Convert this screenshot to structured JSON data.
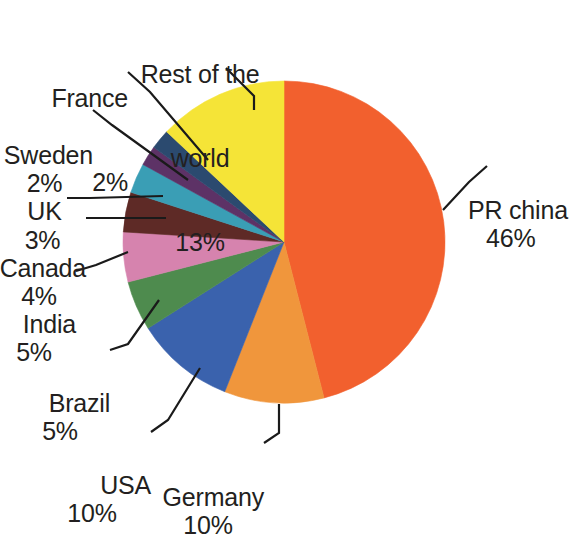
{
  "chart_data": {
    "type": "pie",
    "title": "",
    "subtitle": "",
    "xlabel": "",
    "ylabel": "",
    "legend_position": "none",
    "grid": false,
    "label_format": "name + percent",
    "start_angle_deg": 0,
    "direction": "clockwise",
    "categories": [
      "PR china",
      "Germany",
      "USA",
      "Brazil",
      "India",
      "Canada",
      "UK",
      "Sweden",
      "France",
      "Rest of the world"
    ],
    "values": [
      46,
      10,
      10,
      5,
      5,
      4,
      3,
      2,
      2,
      13
    ],
    "value_labels": [
      "46%",
      "10%",
      "10%",
      "5%",
      "5%",
      "4%",
      "3%",
      "2%",
      "2%",
      "13%"
    ],
    "colors": [
      "#F2602E",
      "#F0963C",
      "#3A62AD",
      "#4E8B4E",
      "#D683AE",
      "#5E2A26",
      "#3A9EB5",
      "#5D3266",
      "#2B4A6F",
      "#F5E437"
    ],
    "slices": [
      {
        "name": "PR china",
        "percent": 46,
        "label": "PR china",
        "value_label": "46%",
        "color": "#F2602E"
      },
      {
        "name": "Germany",
        "percent": 10,
        "label": "Germany",
        "value_label": "10%",
        "color": "#F0963C"
      },
      {
        "name": "USA",
        "percent": 10,
        "label": "USA",
        "value_label": "10%",
        "color": "#3A62AD"
      },
      {
        "name": "Brazil",
        "percent": 5,
        "label": "Brazil",
        "value_label": "5%",
        "color": "#4E8B4E"
      },
      {
        "name": "India",
        "percent": 5,
        "label": "India",
        "value_label": "5%",
        "color": "#D683AE"
      },
      {
        "name": "Canada",
        "percent": 4,
        "label": "Canada",
        "value_label": "4%",
        "color": "#5E2A26"
      },
      {
        "name": "UK",
        "percent": 3,
        "label": "UK",
        "value_label": "3%",
        "color": "#3A9EB5"
      },
      {
        "name": "Sweden",
        "percent": 2,
        "label": "Sweden",
        "value_label": "2%",
        "color": "#5D3266"
      },
      {
        "name": "France",
        "percent": 2,
        "label": "France",
        "value_label": "2%",
        "color": "#2B4A6F"
      },
      {
        "name": "Rest of the world",
        "percent": 13,
        "label": "Rest of the world",
        "value_label": "13%",
        "color": "#F5E437"
      }
    ]
  },
  "labels": {
    "rest_of_world": {
      "line1": "Rest of the",
      "line2": "world",
      "pct": "13%"
    },
    "france": {
      "name": "France",
      "pct": "2%"
    },
    "sweden": {
      "name": "Sweden",
      "pct": "2%"
    },
    "uk": {
      "name": "UK",
      "pct": "3%"
    },
    "canada": {
      "name": "Canada",
      "pct": "4%"
    },
    "india": {
      "name": "India",
      "pct": "5%"
    },
    "brazil": {
      "name": "Brazil",
      "pct": "5%"
    },
    "usa": {
      "name": "USA",
      "pct": "10%"
    },
    "germany": {
      "name": "Germany",
      "pct": "10%"
    },
    "pr_china": {
      "name": "PR china",
      "pct": "46%"
    }
  },
  "style": {
    "background": "#ffffff",
    "text_color": "#231f20",
    "leader_line_color": "#1a1a1a"
  }
}
